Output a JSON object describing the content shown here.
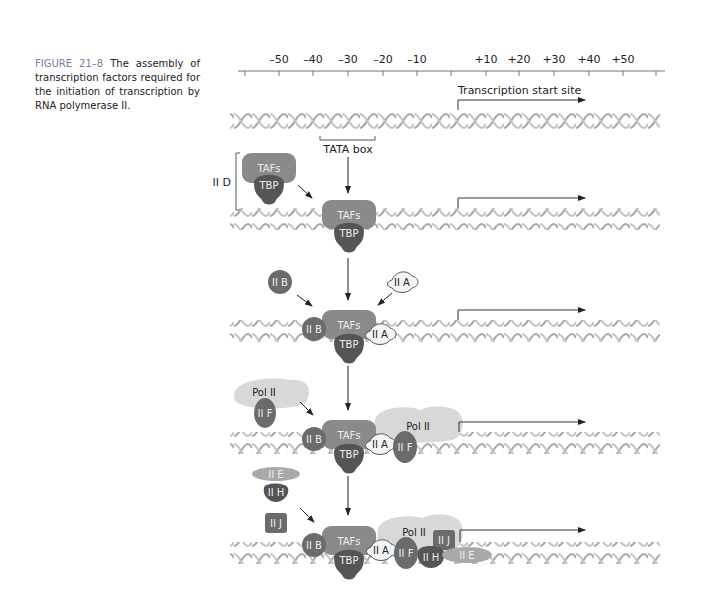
{
  "caption": {
    "figure_label": "FIGURE 21–8",
    "text": " The assembly of transcription factors required for the initiation of transcription by RNA polymerase II."
  },
  "ruler": {
    "ticks": [
      "–50",
      "–40",
      "–30",
      "–20",
      "–10",
      "+10",
      "+20",
      "+30",
      "+40",
      "+50"
    ]
  },
  "labels": {
    "start_site": "Transcription start site",
    "tata_box": "TATA box",
    "iid": "II D",
    "tafs": "TAFs",
    "tbp": "TBP",
    "iib": "II B",
    "iia": "II A",
    "pol2": "Pol II",
    "iif": "II F",
    "iie": "II E",
    "iih": "II H",
    "iij": "II J"
  },
  "colors": {
    "tafs": "#8a8a8a",
    "tbp": "#555555",
    "factor_dark": "#6b6b6b",
    "iia": "#f4f4f4",
    "pol2": "#d8d8d8",
    "iie": "#a9a9a9",
    "dna": "#a8a8a8",
    "caption_accent": "#6f7ea0"
  }
}
